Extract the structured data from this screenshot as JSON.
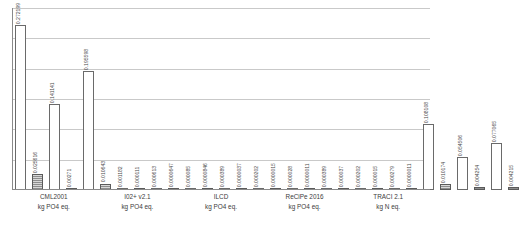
{
  "chart_data": {
    "type": "bar",
    "title": "",
    "xlabel": "",
    "ylabel": "",
    "ylim": [
      0,
      0.3
    ],
    "grid": true,
    "gridlines": [
      0.05,
      0.1,
      0.15,
      0.2,
      0.25,
      0.3
    ],
    "legend": "none",
    "orientation": "vertical",
    "bars_per_group": 6,
    "categories": [
      {
        "name": "CML2001",
        "unit": "kg PO4 eq."
      },
      {
        "name": "I02+ v2.1",
        "unit": "kg PO4 eq."
      },
      {
        "name": "ILCD",
        "unit": "kg PO4 eq."
      },
      {
        "name": "ReCiPe 2016",
        "unit": "kg PO4 eq."
      },
      {
        "name": "TRACI 2.1",
        "unit": "kg N eq."
      }
    ],
    "groups": [
      {
        "category": "CML2001",
        "bars": [
          {
            "value": 0.272199,
            "label": "0.272199",
            "style": "light"
          },
          {
            "value": 0.025616,
            "label": "0.025616",
            "style": "dark"
          },
          {
            "value": 0.141141,
            "label": "0.141141",
            "style": "light"
          },
          {
            "value": 0.00271,
            "label": "0.00271",
            "style": "dark"
          },
          {
            "value": 0.195598,
            "label": "0.195598",
            "style": "light"
          },
          {
            "value": 0.010643,
            "label": "0.010643",
            "style": "dark"
          }
        ]
      },
      {
        "category": "I02+ v2.1",
        "bars": [
          {
            "value": 0.001182,
            "label": "0.001182",
            "style": "light"
          },
          {
            "value": 0.000111,
            "label": "0.000111",
            "style": "dark"
          },
          {
            "value": 0.000613,
            "label": "0.000613",
            "style": "light"
          },
          {
            "value": 6.47e-05,
            "label": "0.0000647",
            "style": "dark"
          },
          {
            "value": 8.5e-05,
            "label": "0.000085",
            "style": "light"
          },
          {
            "value": 8.46e-05,
            "label": "0.0000846",
            "style": "dark"
          }
        ]
      },
      {
        "category": "ILCD",
        "bars": [
          {
            "value": 0.000389,
            "label": "0.000389",
            "style": "light"
          },
          {
            "value": 3.7e-06,
            "label": "0.0000037",
            "style": "dark"
          },
          {
            "value": 0.000202,
            "label": "0.000202",
            "style": "light"
          },
          {
            "value": 1.5e-06,
            "label": "0.0000015",
            "style": "dark"
          },
          {
            "value": 2.8e-05,
            "label": "0.000028",
            "style": "light"
          },
          {
            "value": 1.1e-06,
            "label": "0.0000011",
            "style": "dark"
          }
        ]
      },
      {
        "category": "ReCiPe 2016",
        "bars": [
          {
            "value": 0.000389,
            "label": "0.000389",
            "style": "light"
          },
          {
            "value": 3.7e-05,
            "label": "0.000037",
            "style": "dark"
          },
          {
            "value": 0.000202,
            "label": "0.000202",
            "style": "light"
          },
          {
            "value": 1.5e-05,
            "label": "0.000015",
            "style": "dark"
          },
          {
            "value": 0.000279,
            "label": "0.000279",
            "style": "light"
          },
          {
            "value": 1.1e-06,
            "label": "0.0000011",
            "style": "dark"
          }
        ]
      },
      {
        "category": "TRACI 2.1",
        "bars": [
          {
            "value": 0.108108,
            "label": "0.108108",
            "style": "light"
          },
          {
            "value": 0.010174,
            "label": "0.010174",
            "style": "dark"
          },
          {
            "value": 0.054506,
            "label": "0.054506",
            "style": "light"
          },
          {
            "value": 0.004254,
            "label": "0.004254",
            "style": "dark"
          },
          {
            "value": 0.077065,
            "label": "0.077065",
            "style": "light"
          },
          {
            "value": 0.004215,
            "label": "0.004215",
            "style": "dark"
          }
        ]
      }
    ],
    "colors": {
      "light_bar_fill": "#ffffff",
      "light_bar_stroke": "#6a6a6a",
      "dark_bar_fill": "#8d8d8d",
      "dark_bar_stroke": "#5a5a5a",
      "gridline": "#c9c9c9",
      "axis": "#8a8a8a",
      "text": "#3c3c3c"
    }
  }
}
